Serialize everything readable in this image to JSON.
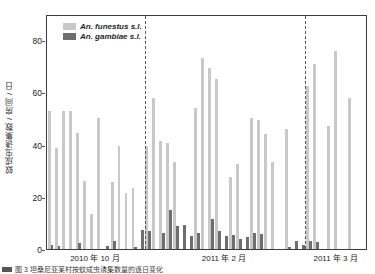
{
  "figure": {
    "caption_text": "图 3  坦桑尼亚某村按蚊成虫诱集数量的逐日变化"
  },
  "legend": {
    "position": "top-left",
    "entries": [
      {
        "label": "An. funestus s.l.",
        "color": "#c8c8c8",
        "key": "funestus"
      },
      {
        "label": "An. gambiae s.l.",
        "color": "#6e6e6e",
        "key": "gambiae"
      }
    ]
  },
  "axes": {
    "y_title": "蚊成虫诱集数 / 房间 / 日",
    "y_ticks": [
      0,
      20,
      40,
      60,
      80
    ],
    "y_min": 0,
    "y_max": 90,
    "x_period_labels": [
      "2010 年 10 月",
      "2011 年 2 月",
      "2011 年 3 月"
    ],
    "grid": "off"
  },
  "separators": {
    "label": "period-divider",
    "after_index": [
      13,
      36
    ]
  },
  "chart_data": {
    "type": "bar",
    "title": "",
    "subtitle": "",
    "xlabel": "",
    "ylabel": "蚊成虫诱集数 / 房间 / 日",
    "ylim": [
      0,
      90
    ],
    "yticks": [
      0,
      20,
      40,
      60,
      80
    ],
    "grid": false,
    "legend_position": "top-left",
    "group_labels": [
      "2010 年 10 月",
      "2011 年 2 月",
      "2011 年 3 月"
    ],
    "group_ranges": [
      [
        0,
        13
      ],
      [
        14,
        36
      ],
      [
        37,
        45
      ]
    ],
    "categories": [
      "d1",
      "d2",
      "d3",
      "d4",
      "d5",
      "d6",
      "d7",
      "d8",
      "d9",
      "d10",
      "d11",
      "d12",
      "d13",
      "d14",
      "d15",
      "d16",
      "d17",
      "d18",
      "d19",
      "d20",
      "d21",
      "d22",
      "d23",
      "d24",
      "d25",
      "d26",
      "d27",
      "d28",
      "d29",
      "d30",
      "d31",
      "d32",
      "d33",
      "d34",
      "d35",
      "d36",
      "d37",
      "d38",
      "d39",
      "d40",
      "d41",
      "d42",
      "d43",
      "d44",
      "d45",
      "d46"
    ],
    "series": [
      {
        "name": "An. funestus s.l.",
        "color": "#c8c8c8",
        "values": [
          53,
          38.5,
          53,
          53,
          44.5,
          26,
          13.5,
          50,
          0,
          25.5,
          39.5,
          21.5,
          23.5,
          0,
          39.5,
          58,
          41.5,
          40.5,
          33.5,
          0,
          0,
          54,
          73,
          69.5,
          65,
          0,
          27.5,
          32.5,
          0,
          50,
          49.5,
          44,
          33.5,
          0,
          46,
          0,
          0,
          62.5,
          71,
          0,
          47,
          76,
          0,
          58,
          0,
          0
        ]
      },
      {
        "name": "An. gambiae s.l.",
        "color": "#6e6e6e",
        "values": [
          1.5,
          1.2,
          0,
          0,
          2.2,
          0,
          0,
          0,
          1.2,
          3.2,
          0,
          0,
          0.6,
          7.3,
          6.8,
          0,
          6.2,
          15,
          9,
          9.3,
          5,
          6,
          0,
          11.5,
          6.8,
          5,
          5.2,
          3.7,
          4.7,
          6,
          5.8,
          0,
          0,
          0,
          0.8,
          3,
          1.7,
          3.2,
          2.6,
          0,
          0,
          0,
          0,
          0,
          0,
          0
        ]
      }
    ]
  }
}
